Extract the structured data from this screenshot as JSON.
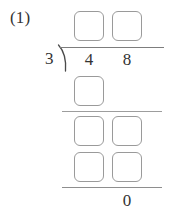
{
  "problem": {
    "label": "(1)",
    "divisor": "3",
    "dividend_digits": [
      "4",
      "8"
    ],
    "remainder": "0",
    "operation": "long-division"
  },
  "quotient_boxes": [
    {
      "value": ""
    },
    {
      "value": ""
    }
  ],
  "work_rows": [
    {
      "name": "first-subtraction",
      "boxes": [
        {
          "value": ""
        }
      ]
    },
    {
      "name": "bring-down",
      "boxes": [
        {
          "value": ""
        },
        {
          "value": ""
        }
      ]
    },
    {
      "name": "second-subtraction",
      "boxes": [
        {
          "value": ""
        },
        {
          "value": ""
        }
      ]
    }
  ],
  "icons": {
    "division_bracket": "division-bracket-icon"
  },
  "colors": {
    "page_background": "#ffffff",
    "ink": "#333333",
    "box_border": "#9a9a9a",
    "rule": "#8e8e8e"
  }
}
